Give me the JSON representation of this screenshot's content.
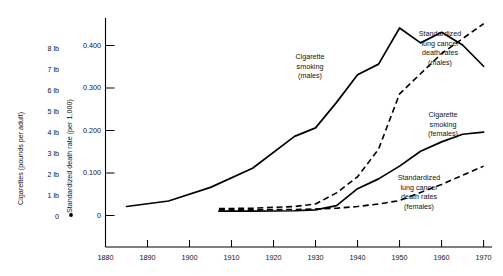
{
  "chart_data": {
    "type": "line",
    "title": "",
    "xlabel": "",
    "ylabel": "Standardized death rate (per 1,000)",
    "y2label": "Cigarettes (pounds per adult)",
    "xlim": [
      1880,
      1972
    ],
    "ylim": [
      0,
      0.47
    ],
    "grid": false,
    "legend_position": "inline-annotations",
    "xticks": [
      1880,
      1890,
      1900,
      1910,
      1920,
      1930,
      1940,
      1950,
      1960,
      1970
    ],
    "xticklabels": [
      "1880",
      "1890",
      "1900",
      "1910",
      "1920",
      "1930",
      "1940",
      "1950",
      "1960",
      "1970"
    ],
    "yticks": [
      0,
      0.1,
      0.2,
      0.3,
      0.4
    ],
    "yticklabels": [
      "0",
      "0.100",
      "0.200",
      "0.300",
      "0.400"
    ],
    "y2ticks": [
      0,
      1,
      2,
      3,
      4,
      5,
      6,
      7,
      8
    ],
    "y2ticklabels": [
      "0",
      "1 lb",
      "2 lb",
      "3 lb",
      "4 lb",
      "5 lb",
      "6 lb",
      "7 lb",
      "8 lb"
    ],
    "series": [
      {
        "name": "Cigarette smoking (males)",
        "style": "solid",
        "axis": "right",
        "annotation": [
          "Cigarette",
          "smoking",
          "(males)"
        ],
        "x": [
          1885,
          1895,
          1905,
          1915,
          1925,
          1930,
          1935,
          1940,
          1945,
          1950,
          1955,
          1960,
          1965,
          1970
        ],
        "y": [
          0.02,
          0.033,
          0.065,
          0.11,
          0.185,
          0.205,
          0.265,
          0.33,
          0.355,
          0.44,
          0.405,
          0.43,
          0.4,
          0.35
        ]
      },
      {
        "name": "Standardized lung cancer death rates (males)",
        "style": "dashed",
        "axis": "left",
        "annotation": [
          "Standardized",
          "lung cancer",
          "death rates",
          "(males)"
        ],
        "x": [
          1907,
          1915,
          1920,
          1925,
          1930,
          1935,
          1940,
          1945,
          1950,
          1960,
          1970
        ],
        "y": [
          0.015,
          0.016,
          0.018,
          0.02,
          0.026,
          0.052,
          0.09,
          0.155,
          0.285,
          0.38,
          0.45
        ]
      },
      {
        "name": "Cigarette smoking (females)",
        "style": "solid",
        "axis": "right",
        "annotation": [
          "Cigarette",
          "smoking",
          "(females)"
        ],
        "x": [
          1907,
          1915,
          1925,
          1930,
          1935,
          1940,
          1945,
          1950,
          1955,
          1960,
          1965,
          1970
        ],
        "y": [
          0.009,
          0.009,
          0.01,
          0.012,
          0.022,
          0.062,
          0.085,
          0.115,
          0.15,
          0.172,
          0.19,
          0.195
        ]
      },
      {
        "name": "Standardized lung cancer death rates (females)",
        "style": "dashed",
        "axis": "left",
        "annotation": [
          "Standardized",
          "lung cancer",
          "death rates",
          "(females)"
        ],
        "x": [
          1907,
          1915,
          1925,
          1930,
          1935,
          1940,
          1945,
          1950,
          1960,
          1970
        ],
        "y": [
          0.012,
          0.012,
          0.013,
          0.014,
          0.016,
          0.02,
          0.026,
          0.034,
          0.072,
          0.115
        ]
      }
    ],
    "origin_dot": {
      "x": 1874,
      "y": 0.0
    }
  },
  "axes": {
    "left_axis_title": "Cigarettes (pounds per adult)",
    "inner_axis_title": "Standardized death rate (per 1,000)"
  }
}
